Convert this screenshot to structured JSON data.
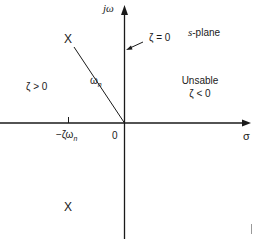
{
  "diagram": {
    "title": "s-plane",
    "axes": {
      "vertical_label": "jω",
      "horizontal_label": "σ",
      "origin_label": "0"
    },
    "annotations": {
      "zeta_zero": "ζ = 0",
      "stable_region": "ζ > 0",
      "unstable_title": "Unsable",
      "unstable_condition": "ζ < 0",
      "radius_label": "ωn",
      "real_part_label": "−ζωn"
    },
    "poles": [
      {
        "symbol": "X",
        "position": "upper-left"
      },
      {
        "symbol": "X",
        "position": "lower-left"
      }
    ],
    "colors": {
      "ink": "#1a1a1a",
      "background": "#ffffff"
    }
  }
}
